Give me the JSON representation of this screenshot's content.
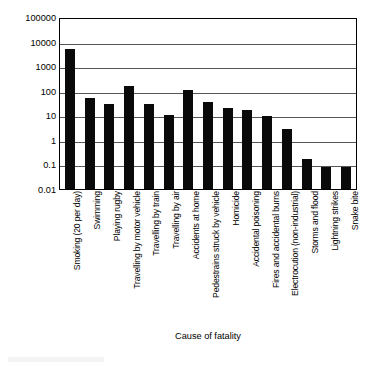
{
  "chart_data": {
    "type": "bar",
    "title": "",
    "xlabel": "Cause of fatality",
    "ylabel": "Fatality risk (per million per year)",
    "yscale": "log",
    "ylim": [
      0.01,
      100000
    ],
    "ytick_labels": [
      "100000",
      "10000",
      "1000",
      "100",
      "10",
      "1",
      "0.1",
      "0.01"
    ],
    "ytick_values": [
      100000,
      10000,
      1000,
      100,
      10,
      1,
      0.1,
      0.01
    ],
    "grid": true,
    "legend": "none",
    "bar_color": "#0a0a0a",
    "categories": [
      "Smoking (20 per day)",
      "Swimming",
      "Playing rugby",
      "Travelling by motor vehicle",
      "Travelling by train",
      "Travelling by air",
      "Accidents at home",
      "Pedestrains struck by vehicle",
      "Homicide",
      "Accidental poisoning",
      "Fires and accidental burns",
      "Electrocution (non-industrial)",
      "Storms and flood",
      "Lightning strikes",
      "Snake bite"
    ],
    "values": [
      5000,
      50,
      30,
      150,
      29,
      10,
      110,
      35,
      19,
      17,
      9,
      2.8,
      0.17,
      0.08,
      0.08
    ]
  }
}
